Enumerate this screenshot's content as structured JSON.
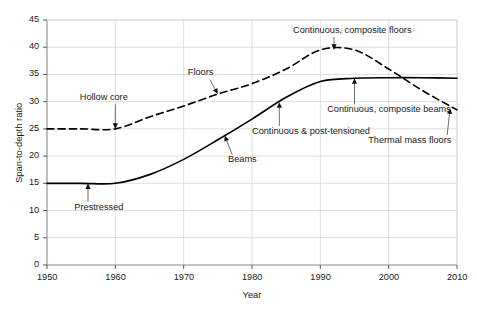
{
  "chart_data": {
    "type": "line",
    "title": "",
    "xlabel": "Year",
    "ylabel": "Span-to-depth ratio",
    "xlim": [
      1950,
      2010
    ],
    "ylim": [
      0,
      45
    ],
    "xticks": [
      1950,
      1960,
      1970,
      1980,
      1990,
      2000,
      2010
    ],
    "yticks": [
      0,
      5,
      10,
      15,
      20,
      25,
      30,
      35,
      40,
      45
    ],
    "grid": true,
    "legend_position": "none",
    "series": [
      {
        "name": "Floors",
        "style": "dashed",
        "color": "#000000",
        "x": [
          1950,
          1955,
          1960,
          1965,
          1970,
          1975,
          1980,
          1985,
          1990,
          1995,
          2000,
          2005,
          2010
        ],
        "values": [
          25.0,
          25.0,
          25.0,
          27.2,
          29.2,
          31.4,
          33.3,
          36.0,
          39.5,
          39.5,
          36.0,
          32.0,
          28.5
        ]
      },
      {
        "name": "Beams",
        "style": "solid",
        "color": "#000000",
        "x": [
          1950,
          1955,
          1960,
          1965,
          1970,
          1975,
          1980,
          1985,
          1990,
          1995,
          2000,
          2005,
          2010
        ],
        "values": [
          15.0,
          15.0,
          15.0,
          16.6,
          19.4,
          23.0,
          26.8,
          30.8,
          33.7,
          34.3,
          34.4,
          34.4,
          34.3
        ]
      }
    ],
    "annotations": [
      {
        "label": "Hollow core",
        "point_x": 1960,
        "point_y": 25.0,
        "text_x": 1954.8,
        "text_y": 30.6
      },
      {
        "label": "Floors",
        "point_x": 1975,
        "point_y": 31.4,
        "text_x": 1970.6,
        "text_y": 35.2
      },
      {
        "label": "Continuous, composite floors",
        "point_x": 1992,
        "point_y": 39.5,
        "text_x": 1986.0,
        "text_y": 43.0
      },
      {
        "label": "Prestressed",
        "point_x": 1956,
        "point_y": 15.0,
        "text_x": 1954.0,
        "text_y": 10.5
      },
      {
        "label": "Beams",
        "point_x": 1976,
        "point_y": 23.8,
        "text_x": 1976.5,
        "text_y": 19.2
      },
      {
        "label": "Continuous & post-tensioned",
        "point_x": 1984,
        "point_y": 29.9,
        "text_x": 1980.0,
        "text_y": 24.4
      },
      {
        "label": "Continuous, composite beams",
        "point_x": 1995,
        "point_y": 34.3,
        "text_x": 1991.0,
        "text_y": 28.4
      },
      {
        "label": "Thermal mass floors",
        "point_x": 2009,
        "point_y": 28.8,
        "text_x": 1997.0,
        "text_y": 22.8
      }
    ]
  },
  "axis": {
    "x_title": "Year",
    "y_title": "Span-to-depth ratio"
  }
}
